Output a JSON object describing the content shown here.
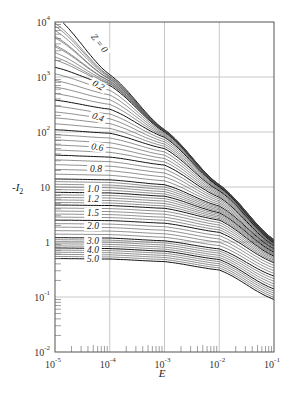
{
  "chart_data": {
    "type": "line",
    "title": "",
    "xlabel": "E",
    "ylabel": "-I2",
    "xscale": "log",
    "yscale": "log",
    "xlim": [
      1e-05,
      0.1
    ],
    "ylim": [
      0.01,
      10000.0
    ],
    "grid": true,
    "legend": "none (inline curve labels)",
    "x_ticks": [
      {
        "base": "10",
        "exp": "-5"
      },
      {
        "base": "10",
        "exp": "-4"
      },
      {
        "base": "10",
        "exp": "-3"
      },
      {
        "base": "10",
        "exp": "-2"
      },
      {
        "base": "10",
        "exp": "-1"
      }
    ],
    "y_ticks": [
      {
        "label": "10",
        "exp": "4",
        "value": 10000.0
      },
      {
        "label": "10",
        "exp": "3",
        "value": 1000.0
      },
      {
        "label": "10",
        "exp": "2",
        "value": 100.0
      },
      {
        "label": "10",
        "exp": "",
        "value": 10
      },
      {
        "label": "1",
        "exp": "",
        "value": 1
      },
      {
        "label": "10",
        "exp": "-1",
        "value": 0.1
      },
      {
        "label": "10",
        "exp": "-2",
        "value": 0.01
      }
    ],
    "curve_parameter": "Z",
    "curve_labels": [
      "Z = 0",
      "0.2",
      "0.4",
      "0.6",
      "0.8",
      "1.0",
      "1.2",
      "1.5",
      "2.0",
      "3.0",
      "4.0",
      "5.0"
    ],
    "series": [
      {
        "name": "Z=0",
        "x": [
          1e-05,
          0.0001,
          0.001,
          0.01,
          0.1
        ],
        "values": [
          13000.0,
          1100.0,
          110,
          11,
          1.1
        ]
      },
      {
        "name": "Z=0.2",
        "x": [
          1e-05,
          0.0001,
          0.001,
          0.01,
          0.1
        ],
        "values": [
          1500,
          700,
          100,
          10.5,
          1.05
        ]
      },
      {
        "name": "Z=0.4",
        "x": [
          1e-05,
          0.0001,
          0.001,
          0.01,
          0.1
        ],
        "values": [
          380,
          260,
          80,
          10,
          1.0
        ]
      },
      {
        "name": "Z=0.6",
        "x": [
          1e-05,
          0.0001,
          0.001,
          0.01,
          0.1
        ],
        "values": [
          110,
          95,
          50,
          8.5,
          0.95
        ]
      },
      {
        "name": "Z=0.8",
        "x": [
          1e-05,
          0.0001,
          0.001,
          0.01,
          0.1
        ],
        "values": [
          38,
          35,
          25,
          6.5,
          0.85
        ]
      },
      {
        "name": "Z=1.0",
        "x": [
          1e-05,
          0.0001,
          0.001,
          0.01,
          0.1
        ],
        "values": [
          14,
          13.5,
          11,
          4.5,
          0.75
        ]
      },
      {
        "name": "Z=1.2",
        "x": [
          1e-05,
          0.0001,
          0.001,
          0.01,
          0.1
        ],
        "values": [
          8,
          7.8,
          6.8,
          3.4,
          0.65
        ]
      },
      {
        "name": "Z=1.5",
        "x": [
          1e-05,
          0.0001,
          0.001,
          0.01,
          0.1
        ],
        "values": [
          4.7,
          4.6,
          4.1,
          2.5,
          0.55
        ]
      },
      {
        "name": "Z=2.0",
        "x": [
          1e-05,
          0.0001,
          0.001,
          0.01,
          0.1
        ],
        "values": [
          2.5,
          2.45,
          2.2,
          1.5,
          0.42
        ]
      },
      {
        "name": "Z=3.0",
        "x": [
          1e-05,
          0.0001,
          0.001,
          0.01,
          0.1
        ],
        "values": [
          1.2,
          1.18,
          1.05,
          0.75,
          0.24
        ]
      },
      {
        "name": "Z=4.0",
        "x": [
          1e-05,
          0.0001,
          0.001,
          0.01,
          0.1
        ],
        "values": [
          0.78,
          0.76,
          0.68,
          0.48,
          0.14
        ]
      },
      {
        "name": "Z=5.0",
        "x": [
          1e-05,
          0.0001,
          0.001,
          0.01,
          0.1
        ],
        "values": [
          0.5,
          0.49,
          0.44,
          0.31,
          0.09
        ]
      }
    ],
    "intermediate_curves_between_labels": 4
  },
  "labels": {
    "x_axis_title": "E",
    "y_axis_title": "-I",
    "y_axis_sub": "2"
  }
}
